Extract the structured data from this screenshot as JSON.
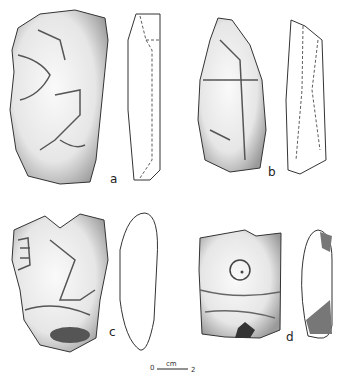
{
  "figure": {
    "labels": {
      "a": "a",
      "b": "b",
      "c": "c",
      "d": "d"
    },
    "scale": {
      "start": "0",
      "unit": "cm",
      "end": "2"
    }
  }
}
